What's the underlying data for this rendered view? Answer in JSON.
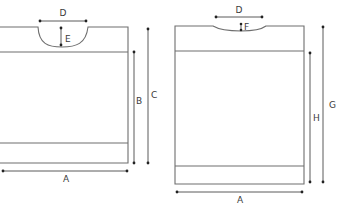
{
  "diagram": {
    "type": "garment-schematic",
    "front": {
      "labels": {
        "neck_width": "D",
        "neck_depth": "E",
        "body_length_to_yoke": "B",
        "total_length": "C",
        "width": "A"
      }
    },
    "back": {
      "labels": {
        "neck_width": "D",
        "neck_depth": "F",
        "body_length_to_yoke": "H",
        "total_length": "G",
        "width": "A"
      }
    }
  },
  "colors": {
    "outline": "#6e6e6e",
    "dimension": "#5a5a5a",
    "text": "#3a3a3a"
  }
}
